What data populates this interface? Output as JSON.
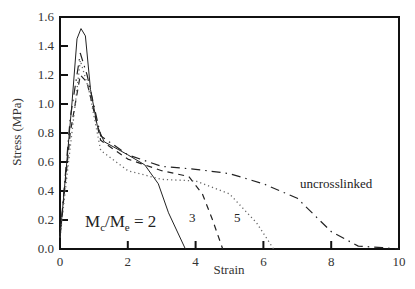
{
  "chart_data": {
    "type": "line",
    "title": "",
    "xlabel": "Strain",
    "ylabel": "Stress (MPa)",
    "xlim": [
      0,
      10
    ],
    "ylim": [
      0.0,
      1.6
    ],
    "xticks": [
      "0",
      "2",
      "4",
      "6",
      "8",
      "10"
    ],
    "yticks": [
      "0.0",
      "0.2",
      "0.4",
      "0.6",
      "0.8",
      "1.0",
      "1.2",
      "1.4",
      "1.6"
    ],
    "grid": false,
    "legend": "none (curves labeled inline)",
    "annotations": [
      {
        "text_main": "M",
        "sub1": "c",
        "slash": "/M",
        "sub2": "e",
        "tail": " = 2",
        "near_series": "Mc/Me = 2"
      },
      {
        "text": "3",
        "near_series": "Mc/Me = 3"
      },
      {
        "text": "5",
        "near_series": "Mc/Me = 5"
      },
      {
        "text": "uncrosslinked",
        "near_series": "uncrosslinked"
      }
    ],
    "series": [
      {
        "name": "Mc/Me = 2",
        "style": "solid",
        "points": [
          [
            0,
            0.08
          ],
          [
            0.2,
            0.6
          ],
          [
            0.35,
            1.0
          ],
          [
            0.5,
            1.45
          ],
          [
            0.62,
            1.52
          ],
          [
            0.75,
            1.47
          ],
          [
            0.9,
            1.1
          ],
          [
            1.1,
            0.85
          ],
          [
            1.3,
            0.74
          ],
          [
            2.0,
            0.65
          ],
          [
            2.5,
            0.58
          ],
          [
            2.9,
            0.45
          ],
          [
            3.2,
            0.25
          ],
          [
            3.7,
            0.0
          ]
        ]
      },
      {
        "name": "Mc/Me = 3",
        "style": "dashed",
        "points": [
          [
            0,
            0.08
          ],
          [
            0.3,
            0.8
          ],
          [
            0.6,
            1.2
          ],
          [
            0.8,
            1.15
          ],
          [
            1.2,
            0.75
          ],
          [
            2.0,
            0.62
          ],
          [
            3.0,
            0.54
          ],
          [
            3.8,
            0.5
          ],
          [
            4.2,
            0.38
          ],
          [
            4.5,
            0.2
          ],
          [
            4.8,
            0.0
          ]
        ]
      },
      {
        "name": "Mc/Me = 5",
        "style": "dotted",
        "points": [
          [
            0,
            0.08
          ],
          [
            0.3,
            0.7
          ],
          [
            0.6,
            1.3
          ],
          [
            0.85,
            1.1
          ],
          [
            1.2,
            0.68
          ],
          [
            2.0,
            0.54
          ],
          [
            3.0,
            0.48
          ],
          [
            4.0,
            0.47
          ],
          [
            5.0,
            0.38
          ],
          [
            5.8,
            0.18
          ],
          [
            6.3,
            0.0
          ]
        ]
      },
      {
        "name": "uncrosslinked",
        "style": "dash-dot",
        "points": [
          [
            0,
            0.08
          ],
          [
            0.3,
            0.9
          ],
          [
            0.6,
            1.35
          ],
          [
            0.8,
            1.2
          ],
          [
            1.2,
            0.78
          ],
          [
            2.0,
            0.65
          ],
          [
            3.0,
            0.57
          ],
          [
            4.0,
            0.55
          ],
          [
            5.0,
            0.52
          ],
          [
            6.0,
            0.45
          ],
          [
            7.0,
            0.35
          ],
          [
            8.0,
            0.12
          ],
          [
            8.8,
            0.02
          ],
          [
            9.5,
            0.01
          ],
          [
            10.0,
            0.0
          ]
        ]
      }
    ]
  }
}
